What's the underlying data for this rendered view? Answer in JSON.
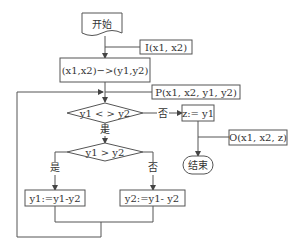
{
  "diagram": {
    "type": "flowchart",
    "nodes": {
      "start": {
        "label": "开始",
        "shape": "document"
      },
      "input": {
        "label": "I(x1, x2)",
        "shape": "annotation"
      },
      "assign": {
        "label": "(x1,x2)−>(y1,y2)",
        "shape": "process"
      },
      "print1": {
        "label": "P(x1, x2, y1, y2)",
        "shape": "annotation"
      },
      "cond1": {
        "label": "y1 < > y2",
        "shape": "decision"
      },
      "zassign": {
        "label": "z:= y1",
        "shape": "process"
      },
      "output": {
        "label": "O(x1, x2, z)",
        "shape": "annotation"
      },
      "end": {
        "label": "结束",
        "shape": "terminator"
      },
      "cond2": {
        "label": "y1 > y2",
        "shape": "decision"
      },
      "sub1": {
        "label": "y1:=y1-y2",
        "shape": "process"
      },
      "sub2": {
        "label": "y2:=y1- y2",
        "shape": "process"
      }
    },
    "edge_labels": {
      "cond1_no": "否",
      "cond1_yes": "是",
      "cond2_yes": "是",
      "cond2_no": "否"
    }
  }
}
